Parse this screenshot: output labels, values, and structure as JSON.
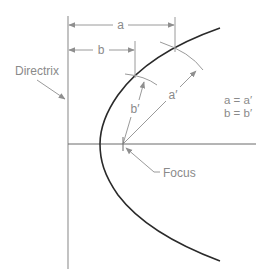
{
  "diagram": {
    "labels": {
      "directrix": "Directrix",
      "focus": "Focus",
      "dim_a": "a",
      "dim_b": "b",
      "dim_a_prime": "a′",
      "dim_b_prime": "b′",
      "eq1": "a = a′",
      "eq2": "b = b′"
    },
    "colors": {
      "curve": "#2a2a2a",
      "construction": "#9a9a9a",
      "axis": "#6a6a6a",
      "text": "#8a8a8a"
    }
  }
}
